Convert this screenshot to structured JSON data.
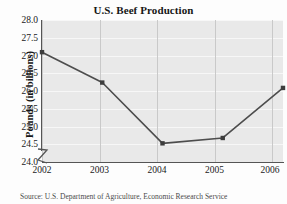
{
  "chart_data": {
    "type": "line",
    "title": "U.S. Beef Production",
    "xlabel": "Year",
    "ylabel": "Pounds (in billions)",
    "categories": [
      "2002",
      "2003",
      "2004",
      "2005",
      "2006"
    ],
    "values": [
      27.1,
      26.25,
      24.55,
      24.7,
      26.1
    ],
    "series": [
      {
        "name": "U.S. Beef Production",
        "values": [
          27.1,
          26.25,
          24.55,
          24.7,
          26.1
        ]
      }
    ],
    "ylim": [
      24.0,
      28.0
    ],
    "ytick_labels": [
      "28.0",
      "27.5",
      "27.0",
      "26.5",
      "26.0",
      "25.5",
      "25.0",
      "24.5",
      "24.0"
    ],
    "ytick_values": [
      28.0,
      27.5,
      27.0,
      26.5,
      26.0,
      25.5,
      25.0,
      24.5,
      24.0
    ],
    "xtick_labels": [
      "2002",
      "2003",
      "2004",
      "2005",
      "2006"
    ],
    "grid": true,
    "legend": "none",
    "axis_break": true,
    "line_color": "#4d4d4d",
    "marker_color": "#3d3d3d",
    "plot_background": "#e9e9e9",
    "gridline_color": "#f7f7f7",
    "axis_color": "#555555"
  },
  "source": {
    "note": "Source: U.S. Department of Agriculture, Economic Research Service"
  }
}
